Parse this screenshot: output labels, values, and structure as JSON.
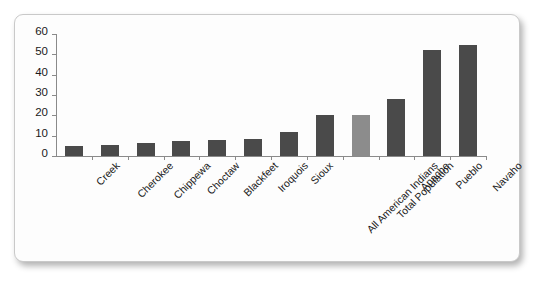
{
  "chart_data": {
    "type": "bar",
    "title": "",
    "xlabel": "",
    "ylabel": "",
    "ylim": [
      0,
      60
    ],
    "ytick_values": [
      0,
      10,
      20,
      30,
      40,
      50,
      60
    ],
    "ytick_labels": [
      "0",
      "10",
      "20",
      "30",
      "40",
      "50",
      "60"
    ],
    "grid": false,
    "legend": "none",
    "categories": [
      "Creek",
      "Cherokee",
      "Chippewa",
      "Choctaw",
      "Blackfeet",
      "Iroquois",
      "Sioux",
      "All American Indians",
      "Total Population",
      "Apache",
      "Pueblo",
      "Navaho"
    ],
    "values": [
      5,
      5.5,
      6.5,
      7.5,
      8,
      8.5,
      12,
      20,
      20,
      28,
      52,
      54.5
    ],
    "bar_colors": [
      "#4a4a4a",
      "#4a4a4a",
      "#4a4a4a",
      "#4a4a4a",
      "#4a4a4a",
      "#4a4a4a",
      "#4a4a4a",
      "#4a4a4a",
      "#8c8c8c",
      "#4a4a4a",
      "#4a4a4a",
      "#4a4a4a"
    ]
  },
  "style": {
    "bar_color_primary": "#4a4a4a",
    "bar_color_highlight": "#8c8c8c",
    "axis_color": "#8a8a8a",
    "text_color": "#1a1a1a",
    "card_background": "#fdfdfd",
    "card_border": "#c9c9c9",
    "page_background": "#ffffff"
  }
}
